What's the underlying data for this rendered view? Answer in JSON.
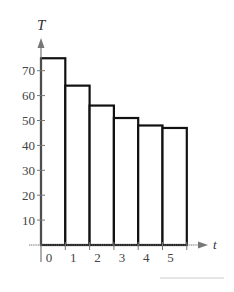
{
  "chart_data": {
    "type": "bar",
    "style": "step / histogram (adjacent unfilled bars with black outlines)",
    "title": "",
    "xlabel": "t",
    "ylabel": "T",
    "x_tick_labels": [
      "0",
      "1",
      "2",
      "3",
      "4",
      "5"
    ],
    "y_tick_labels": [
      "10",
      "20",
      "30",
      "40",
      "50",
      "60",
      "70"
    ],
    "y_ticks": [
      10,
      20,
      30,
      40,
      50,
      60,
      70
    ],
    "categories": [
      "0-1",
      "1-2",
      "2-3",
      "3-4",
      "4-5",
      "5-6"
    ],
    "x_starts": [
      0,
      1,
      2,
      3,
      4,
      5
    ],
    "values": [
      75,
      64,
      56,
      51,
      48,
      47
    ],
    "ylim": [
      0,
      80
    ],
    "xlim": [
      0,
      6.6
    ],
    "grid": false,
    "legend": null,
    "colors": {
      "bar_stroke": "#111111",
      "bar_fill": "#ffffff",
      "axis": "#777777",
      "text": "#444444",
      "footer_line": "#cccccc"
    }
  },
  "labels": {
    "y_axis": "T",
    "x_axis": "t"
  }
}
